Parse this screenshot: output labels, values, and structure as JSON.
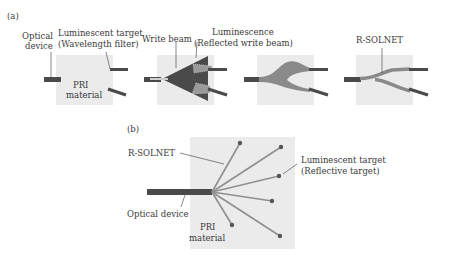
{
  "panel_a": {
    "tag": "(a)",
    "step1": {
      "optical_device_line1": "Optical",
      "optical_device_line2": "device",
      "target_line1": "Luminescent target",
      "target_line2": "(Wavelength filter)",
      "material_line1": "PRI",
      "material_line2": "material"
    },
    "step2": {
      "write_beam": "Write beam",
      "luminescence_line1": "Luminescence",
      "luminescence_line2": "(Reflected write beam)"
    },
    "step4": {
      "rsolnet": "R-SOLNET"
    }
  },
  "panel_b": {
    "tag": "(b)",
    "rsolnet": "R-SOLNET",
    "target_line1": "Luminescent target",
    "target_line2": "(Reflective target)",
    "optical_device": "Optical device",
    "material_line1": "PRI",
    "material_line2": "material"
  },
  "colors": {
    "material_bg": "#ebebeb",
    "device": "#4a4a4a",
    "beam_dark": "#555555",
    "beam_mid": "#8a8a8a",
    "waveguide": "#9a9a9a"
  }
}
